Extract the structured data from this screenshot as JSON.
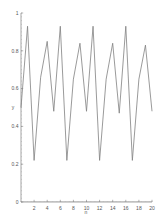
{
  "chart_data": {
    "type": "line",
    "title": "",
    "xlabel": "n",
    "ylabel": "y",
    "xlim": [
      0,
      20
    ],
    "ylim": [
      0,
      1
    ],
    "grid": false,
    "legend": null,
    "x_ticks": [
      2,
      4,
      6,
      8,
      10,
      12,
      14,
      16,
      18,
      20
    ],
    "y_ticks": [
      0,
      0.2,
      0.4,
      0.6,
      0.8,
      1
    ],
    "y_tick_labels": [
      "0",
      "0.2",
      "0.4",
      "0.6",
      "0.8",
      "1"
    ],
    "x_tick_labels": [
      "2",
      "4",
      "6",
      "8",
      "10",
      "12",
      "14",
      "16",
      "18",
      "20"
    ],
    "x": [
      0,
      1,
      2,
      3,
      4,
      5,
      6,
      7,
      8,
      9,
      10,
      11,
      12,
      13,
      14,
      15,
      16,
      17,
      18,
      19,
      20
    ],
    "series": [
      {
        "name": "y",
        "color": "#808080",
        "values": [
          0.5,
          0.93,
          0.22,
          0.66,
          0.85,
          0.48,
          0.93,
          0.22,
          0.65,
          0.84,
          0.48,
          0.93,
          0.22,
          0.65,
          0.84,
          0.47,
          0.93,
          0.22,
          0.65,
          0.83,
          0.48
        ]
      }
    ]
  }
}
